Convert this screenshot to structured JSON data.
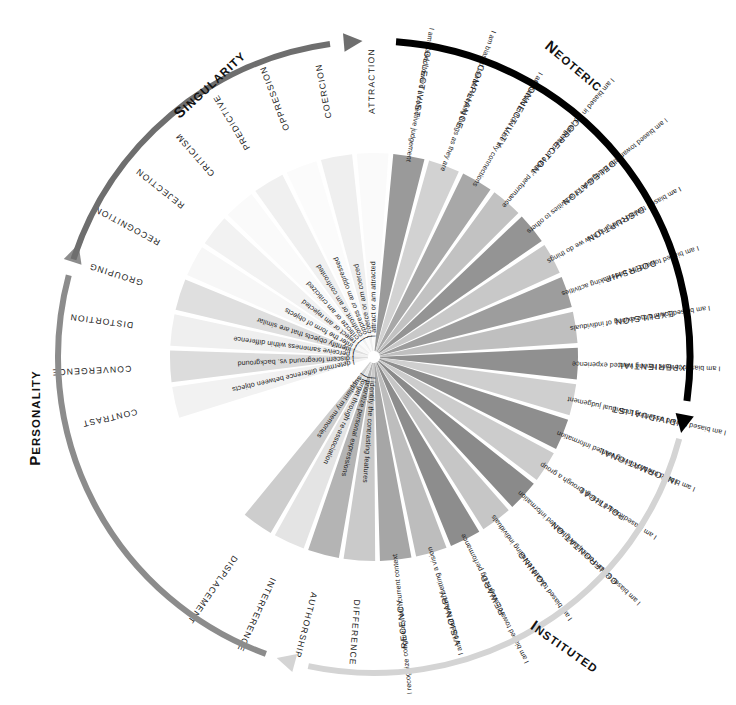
{
  "diagram": {
    "center": {
      "x": 374,
      "y": 357
    },
    "inner_radius": 6,
    "outer_radius": 204,
    "ring_label_radius": 243,
    "colors": {
      "background": "#ffffff",
      "text": "#222222",
      "quadrant_singularity_arc": "#8c8c8c",
      "quadrant_neoteric_arc": "#6e6e6e",
      "quadrant_personality_arc": "#d4d4d4",
      "quadrant_instituted_arc": "#000000"
    },
    "quadrants": [
      {
        "name": "singularity",
        "label": "Singularity",
        "cap": "S",
        "rest": "INGULARITY",
        "arc_color": "#8c8c8c",
        "arc_start_deg": 200,
        "arc_end_deg": 285,
        "x": 213,
        "y": 88,
        "rotate": -43
      },
      {
        "name": "neoteric",
        "label": "Neoteric",
        "cap": "N",
        "rest": "EOTERIC",
        "arc_color": "#6e6e6e",
        "arc_start_deg": 288,
        "arc_end_deg": 352,
        "x": 571,
        "y": 70,
        "rotate": 40
      },
      {
        "name": "personality",
        "label": "Personality",
        "cap": "P",
        "rest": "ERSONALITY",
        "arc_color": "#d4d4d4",
        "arc_start_deg": 105,
        "arc_end_deg": 192,
        "x": 40,
        "y": 418,
        "rotate": -90
      },
      {
        "name": "instituted",
        "label": "Instituted",
        "cap": "I",
        "rest": "NSTITUTED",
        "arc_color": "#000000",
        "arc_start_deg": 4,
        "arc_end_deg": 98,
        "x": 562,
        "y": 651,
        "rotate": 35
      }
    ],
    "segments": [
      {
        "ring": "CONTRAST",
        "statement": "I determine difference between objects",
        "shade": "#f2f2f2",
        "quadrant": "singularity"
      },
      {
        "ring": "CONVERGENCE",
        "statement": "I discern foreground vs. background",
        "shade": "#dcdcdc",
        "quadrant": "singularity"
      },
      {
        "ring": "DISTORTION",
        "statement": "I perceive sameness within difference",
        "shade": "#efefef",
        "quadrant": "singularity"
      },
      {
        "ring": "GROUPING",
        "statement": "I identify objects that are similar",
        "shade": "#dfdfdf",
        "quadrant": "singularity"
      },
      {
        "ring": "RECOGNITION",
        "statement": "I infer the form of objects",
        "shade": "#f7f7f7",
        "quadrant": "singularity"
      },
      {
        "ring": "REJECTION",
        "statement": "I reject or am rejected",
        "shade": "#f2f2f2",
        "quadrant": "personality"
      },
      {
        "ring": "CRITICISM",
        "statement": "I criticize or am criticized",
        "shade": "#fafafa",
        "quadrant": "personality"
      },
      {
        "ring": "PREDICTIVE",
        "statement": "I confront or am confronted",
        "shade": "#f0f0f0",
        "quadrant": "personality"
      },
      {
        "ring": "OPPRESSION",
        "statement": "I oppress or am oppressed",
        "shade": "#fbfbfb",
        "quadrant": "personality"
      },
      {
        "ring": "COERCION",
        "statement": "I coerce or am coerced",
        "shade": "#efefef",
        "quadrant": "personality"
      },
      {
        "ring": "ATTRACTION",
        "statement": "I attract or am attracted",
        "shade": "#fafafa",
        "quadrant": "personality"
      },
      {
        "ring": "COLLECTIVIST",
        "statement": "I am biased toward a collective judgement",
        "shade": "#9a9a9a",
        "quadrant": "instituted"
      },
      {
        "ring": "COMPLIANCE",
        "statement": "I am biased toward keeping things as they are",
        "shade": "#d2d2d2",
        "quadrant": "instituted"
      },
      {
        "ring": "CONNECTIVITY",
        "statement": "I am biased in how I use my connections",
        "shade": "#a8a8a8",
        "quadrant": "instituted"
      },
      {
        "ring": "CORRECTION",
        "statement": "I am biased in my judgement of others' performance",
        "shade": "#c2c2c2",
        "quadrant": "instituted"
      },
      {
        "ring": "DELEGATION",
        "statement": "I am biased toward the delegation of activities to others",
        "shade": "#949494",
        "quadrant": "instituted"
      },
      {
        "ring": "DISRUPTION",
        "statement": "I am biased toward changing how we do things",
        "shade": "#c8c8c8",
        "quadrant": "instituted"
      },
      {
        "ring": "DOERSHIP",
        "statement": "I am biased toward the undertaking activities",
        "shade": "#9d9d9d",
        "quadrant": "instituted"
      },
      {
        "ring": "EXPULSION",
        "statement": "I am biased toward the exiting of individuals",
        "shade": "#bfbfbf",
        "quadrant": "instituted"
      },
      {
        "ring": "EXPERIENTIAL",
        "statement": "I am biased toward having wanted experience",
        "shade": "#909090",
        "quadrant": "instituted"
      },
      {
        "ring": "INDIVIDUALIST",
        "statement": "I am biased toward asserting individual judgement",
        "shade": "#cfcfcf",
        "quadrant": "instituted"
      },
      {
        "ring": "INFORMATIONAL",
        "statement": "I am biased toward having wanted information",
        "shade": "#8e8e8e",
        "quadrant": "instituted"
      },
      {
        "ring": "POLITICAL",
        "statement": "I am biased toward acting through a group",
        "shade": "#cccccc",
        "quadrant": "instituted"
      },
      {
        "ring": "CONFRONTATION",
        "statement": "I am biased toward anticipating wanted information",
        "shade": "#8a8a8a",
        "quadrant": "instituted"
      },
      {
        "ring": "JOINING",
        "statement": "I am biased toward recruiting individuals",
        "shade": "#c6c6c6",
        "quadrant": "neoteric"
      },
      {
        "ring": "REWARD",
        "statement": "I am biased toward recognizing performance",
        "shade": "#8d8d8d",
        "quadrant": "neoteric"
      },
      {
        "ring": "VISIONARY",
        "statement": "I am biased toward setting a vision",
        "shade": "#bdbdbd",
        "quadrant": "neoteric"
      },
      {
        "ring": "RECENCY",
        "statement": "I recognize congruency with current context",
        "shade": "#a6a6a6",
        "quadrant": "neoteric"
      },
      {
        "ring": "DIFFERENCE",
        "statement": "I identify the contrasting features",
        "shade": "#cacaca",
        "quadrant": "neoteric"
      },
      {
        "ring": "AUTHORSHIP",
        "statement": "I prioritize personal expressions",
        "shade": "#b4b4b4",
        "quadrant": "neoteric"
      },
      {
        "ring": "INTERFERENCE",
        "statement": "I forget through re-association",
        "shade": "#e4e4e4",
        "quadrant": "neoteric"
      },
      {
        "ring": "DISPLACEMENT",
        "statement": "I supplant my memories",
        "shade": "#cdcdcd",
        "quadrant": "neoteric"
      }
    ]
  }
}
